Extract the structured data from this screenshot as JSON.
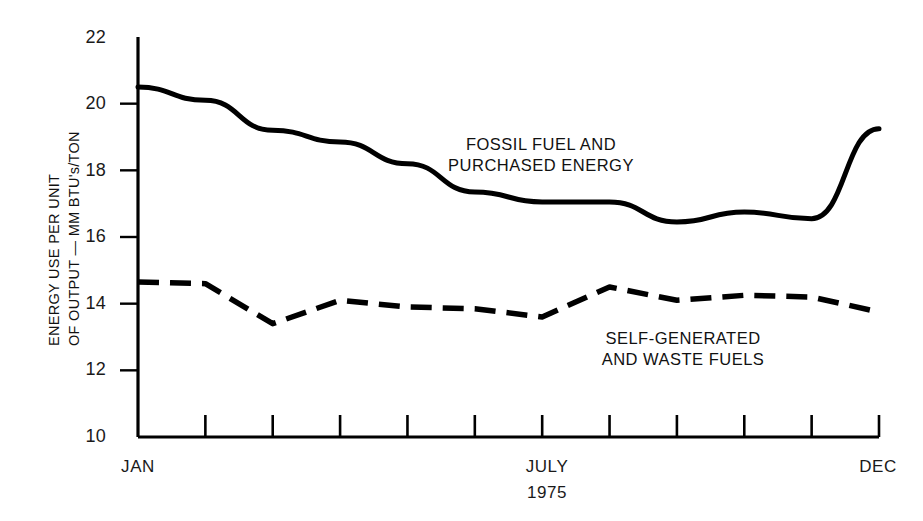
{
  "chart_data": {
    "type": "line",
    "title": "",
    "subtitle": "",
    "xlabel": "1975",
    "ylabel": "ENERGY USE PER UNIT OF OUTPUT — MM BTU's/TON",
    "ylabel_lines": [
      "ENERGY USE PER UNIT",
      "OF OUTPUT — MM BTU's/TON"
    ],
    "xlim": [
      1,
      12
    ],
    "ylim": [
      10,
      22
    ],
    "grid": false,
    "legend_position": "inline-annotation",
    "y_ticks": [
      10,
      12,
      14,
      16,
      18,
      20,
      22
    ],
    "y_tick_labels": [
      "10",
      "12",
      "14",
      "16",
      "18",
      "20",
      "22"
    ],
    "x_ticks": [
      1,
      2,
      3,
      4,
      5,
      6,
      7,
      8,
      9,
      10,
      11,
      12
    ],
    "x_tick_labels": [
      "JAN",
      "",
      "",
      "",
      "",
      "",
      "JULY",
      "",
      "",
      "",
      "",
      "DEC"
    ],
    "x_labeled": [
      {
        "index": 1,
        "label": "JAN"
      },
      {
        "index": 7,
        "label": "JULY"
      },
      {
        "index": 12,
        "label": "DEC"
      }
    ],
    "categories": [
      "JAN",
      "FEB",
      "MAR",
      "APR",
      "MAY",
      "JUN",
      "JULY",
      "AUG",
      "SEP",
      "OCT",
      "NOV",
      "DEC"
    ],
    "series": [
      {
        "name": "FOSSIL FUEL AND PURCHASED ENERGY",
        "style": "solid",
        "color": "#000000",
        "values": [
          20.5,
          20.1,
          19.2,
          18.85,
          18.2,
          17.35,
          17.05,
          17.05,
          16.45,
          16.75,
          16.55,
          19.25
        ]
      },
      {
        "name": "SELF-GENERATED AND WASTE FUELS",
        "style": "dashed",
        "color": "#000000",
        "values": [
          14.65,
          14.6,
          13.4,
          14.1,
          13.9,
          13.85,
          13.6,
          14.5,
          14.1,
          14.25,
          14.2,
          13.75
        ]
      }
    ],
    "annotations": [
      {
        "id": "fossil",
        "lines": [
          "FOSSIL FUEL AND",
          "PURCHASED ENERGY"
        ],
        "x_center": 541,
        "y_top": 134
      },
      {
        "id": "self-generated",
        "lines": [
          "SELF-GENERATED",
          "AND WASTE FUELS"
        ],
        "x_center": 683,
        "y_top": 328
      }
    ]
  },
  "axis": {
    "y_label_line1": "ENERGY USE PER UNIT",
    "y_label_line2": "OF OUTPUT — MM BTU's/TON",
    "y_ticks": [
      "22",
      "20",
      "18",
      "16",
      "14",
      "12",
      "10"
    ],
    "x_jan": "JAN",
    "x_july": "JULY",
    "x_year": "1975",
    "x_dec": "DEC"
  },
  "annotations": {
    "fossil_line1": "FOSSIL FUEL AND",
    "fossil_line2": "PURCHASED ENERGY",
    "self_line1": "SELF-GENERATED",
    "self_line2": "AND WASTE FUELS"
  },
  "colors": {
    "ink": "#000000",
    "background": "#ffffff",
    "text": "#1a1a1a"
  }
}
